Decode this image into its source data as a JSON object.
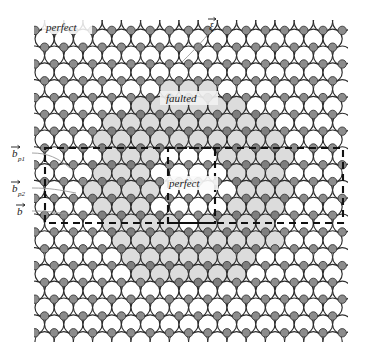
{
  "figure": {
    "labels": {
      "top_left": "perfect",
      "faulted": "faulted",
      "inner_perfect": "perfect",
      "xi": "ξ",
      "bp1_base": "b",
      "bp1_sub": "p1",
      "bp2_base": "b",
      "bp2_sub": "p2",
      "b_base": "b"
    },
    "colors": {
      "background": "#ffffff",
      "atom_fill_perfect": "#ffffff",
      "atom_fill_faulted": "#dcdcdc",
      "atom_stroke": "#2b2b2b",
      "interstitial_fill": "#8c8c8c",
      "interstitial_stroke": "#3a3a3a",
      "faulted_disk": "#e6e6e6",
      "dashed_line": "#111111",
      "leader_line": "#8f8f8f"
    },
    "geometry": {
      "lattice_left": 35,
      "lattice_top": 22,
      "lattice_right": 346,
      "lattice_bottom": 340,
      "atom_radius": 9.6,
      "col_spacing": 19.2,
      "row_spacing": 16.8,
      "interstitial_radius": 4.2,
      "faulted_center_x": 190,
      "faulted_center_y": 186,
      "faulted_radius": 101,
      "inner_center_x": 190,
      "inner_center_y": 186,
      "inner_radius": 40,
      "outer_dash_rect": [
        45,
        148,
        298,
        75
      ],
      "inner_dash_rect": [
        168,
        148,
        47,
        75
      ]
    },
    "annotation_counts": {
      "rows": 19,
      "dashed_rectangles": 2,
      "vector_labels": 3
    }
  }
}
